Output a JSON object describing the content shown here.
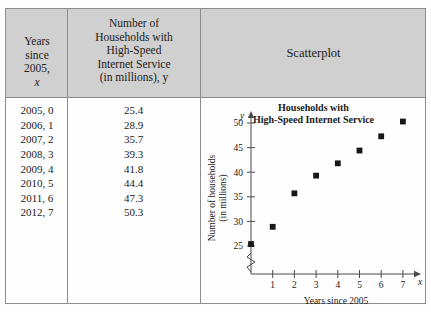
{
  "table": {
    "headers": {
      "col1_lines": [
        "Years",
        "since",
        "2005,"
      ],
      "col1_var": "x",
      "col2_lines": [
        "Number of",
        "Households with",
        "High-Speed",
        "Internet Service",
        "(in millions), y"
      ],
      "col3": "Scatterplot"
    },
    "rows": [
      {
        "x": "2005, 0",
        "y": "25.4"
      },
      {
        "x": "2006, 1",
        "y": "28.9"
      },
      {
        "x": "2007, 2",
        "y": "35.7"
      },
      {
        "x": "2008, 3",
        "y": "39.3"
      },
      {
        "x": "2009, 4",
        "y": "41.8"
      },
      {
        "x": "2010, 5",
        "y": "44.4"
      },
      {
        "x": "2011, 6",
        "y": "47.3"
      },
      {
        "x": "2012, 7",
        "y": "50.3"
      }
    ]
  },
  "chart_data": {
    "type": "scatter",
    "title": "Households with High-Speed Internet Service",
    "title_lines": [
      "Households with",
      "High-Speed Internet Service"
    ],
    "xlabel": "Years since 2005",
    "ylabel": "Number of households (in millions)",
    "ylabel_lines": [
      "Number of households",
      "(in millions)"
    ],
    "x_axis_var": "x",
    "y_axis_var": "y",
    "x": [
      0,
      1,
      2,
      3,
      4,
      5,
      6,
      7
    ],
    "values": [
      25.4,
      28.9,
      35.7,
      39.3,
      41.8,
      44.4,
      47.3,
      50.3
    ],
    "xticks": [
      1,
      2,
      3,
      4,
      5,
      6,
      7
    ],
    "yticks": [
      25,
      30,
      35,
      40,
      45,
      50
    ],
    "xlim": [
      0,
      8
    ],
    "ylim": [
      25,
      52
    ],
    "y_axis_break": true,
    "grid": false,
    "legend": false,
    "marker": "square",
    "marker_color": "#171717"
  },
  "colors": {
    "header_band": "#cfd0cf",
    "border": "#8d8d8d",
    "text": "#1b1b1b",
    "page_background": "#fdfdfd"
  }
}
